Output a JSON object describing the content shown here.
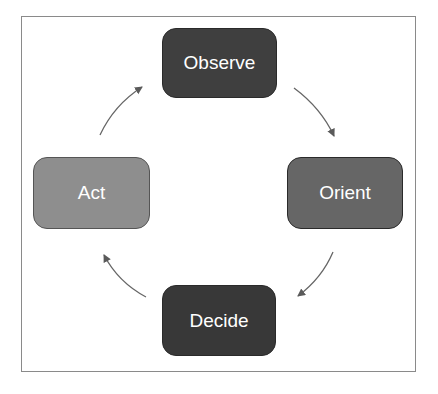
{
  "diagram": {
    "type": "cycle",
    "title": "",
    "nodes": [
      {
        "id": "observe",
        "label": "Observe",
        "position": "top",
        "fill": "#3f3f3f"
      },
      {
        "id": "orient",
        "label": "Orient",
        "position": "right",
        "fill": "#666666"
      },
      {
        "id": "decide",
        "label": "Decide",
        "position": "bottom",
        "fill": "#383838"
      },
      {
        "id": "act",
        "label": "Act",
        "position": "left",
        "fill": "#8e8e8e"
      }
    ],
    "edges": [
      {
        "from": "observe",
        "to": "orient"
      },
      {
        "from": "orient",
        "to": "decide"
      },
      {
        "from": "decide",
        "to": "act"
      },
      {
        "from": "act",
        "to": "observe"
      }
    ],
    "arrow_color": "#666666",
    "frame_color": "#8a8a8a"
  }
}
